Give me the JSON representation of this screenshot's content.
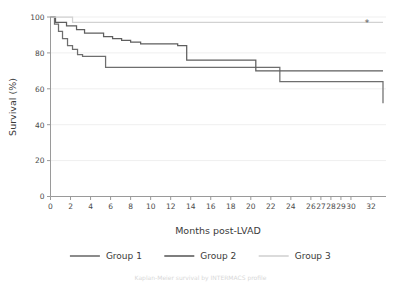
{
  "chart_data": {
    "type": "line",
    "title": "",
    "xlabel": "Months post-LVAD",
    "ylabel": "Survival (%)",
    "xlim": [
      0,
      33.5
    ],
    "ylim": [
      0,
      100
    ],
    "grid": true,
    "grid_axis": "y",
    "legend_position": "bottom",
    "step": "post",
    "xticks": [
      0,
      2,
      4,
      6,
      8,
      10,
      12,
      14,
      16,
      18,
      20,
      22,
      24,
      26,
      27,
      28,
      29,
      30,
      32
    ],
    "xticklabels": [
      "0",
      "2",
      "4",
      "6",
      "8",
      "10",
      "12",
      "14",
      "16",
      "18",
      "20",
      "22",
      "24",
      "26",
      "27",
      "28",
      "29",
      "30",
      "32"
    ],
    "yticks": [
      0,
      20,
      40,
      60,
      80,
      100
    ],
    "yticklabels": [
      "0",
      "20",
      "40",
      "60",
      "80",
      "100"
    ],
    "annotations": [
      {
        "text": "*",
        "x": 31.6,
        "y": 96.5,
        "name": "significance-asterisk"
      }
    ],
    "series": [
      {
        "name": "Group 1",
        "color": "#6e6e6e",
        "x": [
          0,
          0.4,
          0.8,
          1.2,
          1.7,
          2.2,
          2.7,
          3.2,
          5.5,
          10.5,
          22.9,
          33.2
        ],
        "y": [
          100,
          96,
          92,
          88,
          84,
          82,
          79,
          78,
          72,
          72,
          64,
          52
        ],
        "final_value": 52
      },
      {
        "name": "Group 2",
        "color": "#5e5e5e",
        "x": [
          0,
          0.5,
          1.6,
          2.6,
          3.4,
          4.4,
          5.3,
          6.2,
          7.1,
          8.0,
          9.0,
          12.7,
          13.6,
          19.5,
          20.5,
          33.2
        ],
        "y": [
          100,
          97,
          95,
          93,
          91,
          91,
          89,
          88,
          87,
          86,
          85,
          84,
          76,
          76,
          70,
          70
        ],
        "final_value": 70
      },
      {
        "name": "Group 3",
        "color": "#d2d2d2",
        "x": [
          0,
          1.8,
          2.2,
          33.2
        ],
        "y": [
          100,
          100,
          97,
          97
        ],
        "final_value": 97
      }
    ]
  },
  "legend": {
    "items": [
      {
        "label": "Group 1",
        "color": "#6e6e6e"
      },
      {
        "label": "Group 2",
        "color": "#5e5e5e"
      },
      {
        "label": "Group 3",
        "color": "#d2d2d2"
      }
    ]
  },
  "axes": {
    "x_title": "Months post-LVAD",
    "y_title": "Survival (%)"
  },
  "caption": {
    "text": "Kaplan-Meier survival by INTERMACS profile"
  }
}
